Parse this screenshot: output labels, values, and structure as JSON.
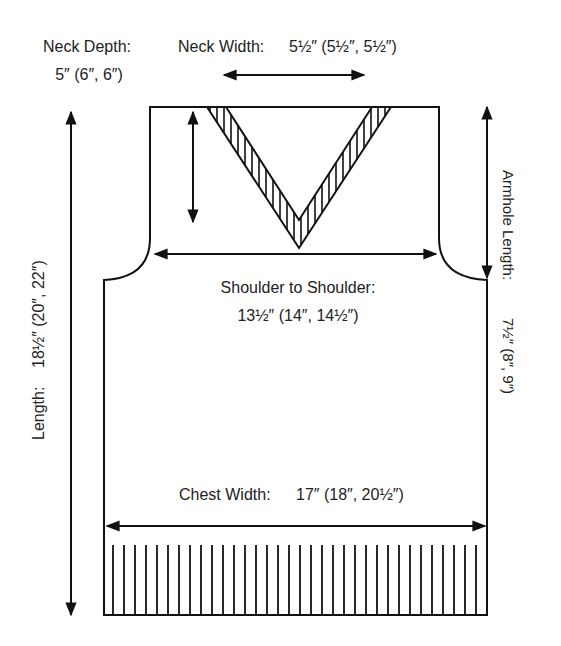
{
  "diagram": {
    "type": "knitting-schematic-vest-front",
    "colors": {
      "line": "#111111",
      "text": "#222222",
      "background": "#ffffff"
    },
    "labels": {
      "neck_depth": {
        "title": "Neck Depth:",
        "value": "5″ (6″, 6″)"
      },
      "neck_width": {
        "title": "Neck Width:",
        "value": "5½″ (5½″, 5½″)"
      },
      "shoulder_to_shoulder": {
        "title": "Shoulder to Shoulder:",
        "value": "13½″ (14″, 14½″)"
      },
      "armhole_length": {
        "title": "Armhole Length:",
        "value": "7½″ (8″, 9″)"
      },
      "length": {
        "title": "Length:",
        "value": "18½″ (20″, 22″)"
      },
      "chest_width": {
        "title": "Chest Width:",
        "value": "17″ (18″, 20½″)"
      }
    }
  }
}
